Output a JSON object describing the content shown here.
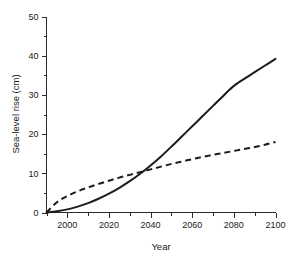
{
  "chart_data": {
    "type": "line",
    "title": "",
    "xlabel": "Year",
    "ylabel": "Sea-level rise (cm)",
    "xlim": [
      1990,
      2100
    ],
    "ylim": [
      0,
      50
    ],
    "grid": false,
    "legend": "none",
    "x_ticks_major": [
      2000,
      2020,
      2040,
      2060,
      2080,
      2100
    ],
    "x_tick_labels": [
      "2000",
      "2020",
      "2040",
      "2060",
      "2080",
      "2100"
    ],
    "x_ticks_minor": [
      1990,
      2010,
      2030,
      2050,
      2070,
      2090
    ],
    "y_ticks_major": [
      0,
      10,
      20,
      30,
      40,
      50
    ],
    "y_tick_labels": [
      "0",
      "10",
      "20",
      "30",
      "40",
      "50"
    ],
    "y_ticks_minor": [
      5,
      15,
      25,
      35,
      45
    ],
    "x": [
      1990,
      1995,
      2000,
      2005,
      2010,
      2015,
      2020,
      2025,
      2030,
      2035,
      2040,
      2045,
      2050,
      2055,
      2060,
      2065,
      2070,
      2075,
      2080,
      2085,
      2090,
      2095,
      2100
    ],
    "series": [
      {
        "name": "solid-curve",
        "style": "solid",
        "color": "#1c1c1c",
        "values": [
          0.0,
          0.3,
          0.8,
          1.5,
          2.4,
          3.5,
          4.8,
          6.3,
          8.0,
          9.9,
          12.0,
          14.3,
          16.8,
          19.4,
          22.0,
          24.6,
          27.2,
          29.8,
          32.3,
          34.1,
          35.8,
          37.5,
          39.2
        ]
      },
      {
        "name": "dashed-curve",
        "style": "dashed",
        "color": "#1c1c1c",
        "values": [
          0.0,
          2.6,
          4.2,
          5.4,
          6.4,
          7.3,
          8.1,
          8.9,
          9.6,
          10.3,
          11.0,
          11.7,
          12.4,
          13.0,
          13.6,
          14.2,
          14.7,
          15.2,
          15.7,
          16.2,
          16.7,
          17.3,
          18.0
        ]
      }
    ]
  },
  "figure": {
    "background_color": "#ffffff",
    "axis_color": "#2b2b2b",
    "text_color": "#1a1a1a"
  }
}
